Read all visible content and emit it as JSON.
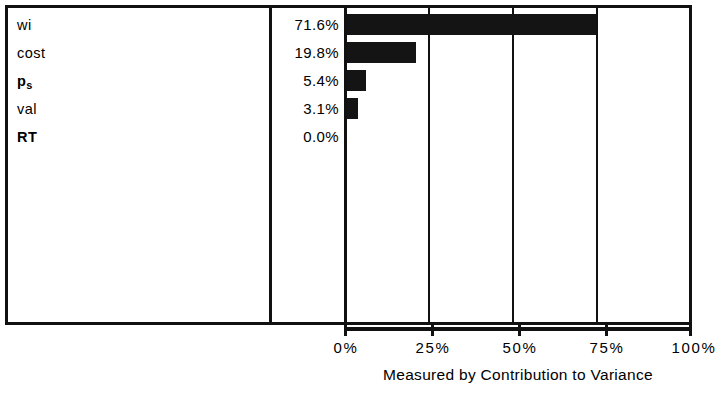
{
  "chart_data": {
    "type": "bar",
    "orientation": "horizontal",
    "title": "",
    "xlabel": "Measured by Contribution to Variance",
    "ylabel": "",
    "xlim": [
      0,
      100
    ],
    "grid": true,
    "legend": null,
    "categories": [
      "wi",
      "p_s",
      "cost",
      "val",
      "RT"
    ],
    "rows": [
      {
        "label": "wi",
        "label_sub": "",
        "value_text": "71.6%",
        "value": 71.6,
        "bold": false
      },
      {
        "label": "cost",
        "label_sub": "",
        "value_text": "19.8%",
        "value": 19.8,
        "bold": false
      },
      {
        "label": "p",
        "label_sub": "s",
        "value_text": "5.4%",
        "value": 5.4,
        "bold": true
      },
      {
        "label": "val",
        "label_sub": "",
        "value_text": "3.1%",
        "value": 3.1,
        "bold": false
      },
      {
        "label": "RT",
        "label_sub": "",
        "value_text": "0.0%",
        "value": 0.0,
        "bold": true
      }
    ],
    "values": [
      71.6,
      19.8,
      5.4,
      3.1,
      0.0
    ],
    "tick_labels": [
      "0%",
      "25%",
      "50%",
      "75%",
      "100%"
    ],
    "tick_values": [
      0,
      25,
      50,
      75,
      100
    ],
    "bar_color": "#141414",
    "frame_color": "#111111",
    "background_color": "#ffffff"
  }
}
